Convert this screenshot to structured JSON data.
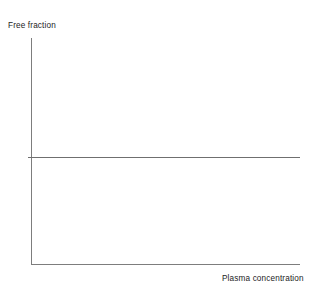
{
  "figure": {
    "width": 316,
    "height": 285,
    "background_color": "#ffffff",
    "axis_color": "#7d7d7d",
    "series_color": "#6f6f6f",
    "text_color": "#1c1c1c"
  },
  "labels": {
    "y_axis": "Free fraction",
    "x_axis": "Plasma concentration"
  },
  "chart_data": {
    "type": "line",
    "title": "",
    "subtitle": "",
    "xlabel": "Plasma concentration",
    "ylabel": "Free fraction",
    "xlim": [
      0,
      1
    ],
    "ylim": [
      0,
      1
    ],
    "xticks": [],
    "yticks": [],
    "xticklabels": [],
    "yticklabels": [],
    "grid": false,
    "legend": null,
    "annotations": [],
    "series": [
      {
        "name": "Free fraction",
        "x": [
          0,
          1
        ],
        "values": [
          0.474,
          0.474
        ],
        "color": "#6f6f6f",
        "linewidth": 1,
        "style": "solid",
        "description": "Constant free fraction, independent of plasma concentration"
      }
    ]
  }
}
